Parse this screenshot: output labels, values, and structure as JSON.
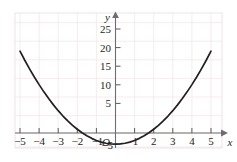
{
  "figure": {
    "title": "",
    "background_color": "#ffffff",
    "width": 237,
    "height": 162
  },
  "axes": {
    "x_axis_label": "x",
    "y_axis_label": "y",
    "origin_label": "O",
    "axis_color": "#58595b",
    "grid_color": "#f0e6e8",
    "curve_color": "#231f20",
    "x_tick_labels": [
      "−5",
      "−4",
      "−3",
      "−2",
      "−1",
      "1",
      "2",
      "3",
      "4",
      "5"
    ],
    "y_tick_labels": [
      "25",
      "20",
      "15",
      "10",
      "5",
      "−5"
    ]
  },
  "chart_data": {
    "type": "line",
    "title": "",
    "xlabel": "x",
    "ylabel": "y",
    "xlim": [
      -5.6,
      5.8
    ],
    "ylim": [
      -6,
      27
    ],
    "grid": true,
    "legend": "none",
    "x_ticks": [
      -5,
      -4,
      -3,
      -2,
      -1,
      1,
      2,
      3,
      4,
      5
    ],
    "y_ticks": [
      25,
      20,
      15,
      10,
      5,
      -5
    ],
    "series": [
      {
        "name": "y = x² − 3",
        "equation": "y = x^2 - 3",
        "vertex": [
          0,
          -3
        ],
        "x_intercepts": [
          -1.73,
          1.73
        ],
        "y_intercept": -3,
        "x": [
          -5.0,
          -4.75,
          -4.5,
          -4.25,
          -4.0,
          -3.75,
          -3.5,
          -3.25,
          -3.0,
          -2.75,
          -2.5,
          -2.25,
          -2.0,
          -1.75,
          -1.5,
          -1.25,
          -1.0,
          -0.75,
          -0.5,
          -0.25,
          0.0,
          0.25,
          0.5,
          0.75,
          1.0,
          1.25,
          1.5,
          1.75,
          2.0,
          2.25,
          2.5,
          2.75,
          3.0,
          3.25,
          3.5,
          3.75,
          4.0,
          4.25,
          4.5,
          4.75,
          5.0
        ],
        "y": [
          22.0,
          19.56,
          17.25,
          15.06,
          13.0,
          11.06,
          9.25,
          7.56,
          6.0,
          4.56,
          3.25,
          2.06,
          1.0,
          0.06,
          -0.75,
          -1.44,
          -2.0,
          -2.44,
          -2.75,
          -2.94,
          -3.0,
          -2.94,
          -2.75,
          -2.44,
          -2.0,
          -1.44,
          -0.75,
          0.06,
          1.0,
          2.06,
          3.25,
          4.56,
          6.0,
          7.56,
          9.25,
          11.06,
          13.0,
          15.06,
          17.25,
          19.56,
          22.0
        ]
      }
    ]
  }
}
